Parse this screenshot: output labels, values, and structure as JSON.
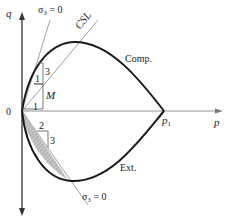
{
  "diagram": {
    "axes": {
      "x_label": "p",
      "y_label": "q",
      "origin_label": "0"
    },
    "points": {
      "p1_label": "p",
      "p1_subscript": "1"
    },
    "curves": {
      "compression_label": "Comp.",
      "extension_label": "Ext."
    },
    "lines": {
      "csl_label": "CSL",
      "sigma3_upper_label": "σ₃ = 0",
      "sigma3_lower_label": "σ₃ = 0"
    },
    "slope_triangles": {
      "upper_rise": "3",
      "upper_run": "1",
      "csl_rise": "M",
      "csl_run": "1",
      "lower_run": "2",
      "lower_rise": "3"
    },
    "colors": {
      "curve": "#1a1a1a",
      "axis": "#333333",
      "thin_line": "#888888",
      "hatch": "#9a9a9a"
    }
  }
}
